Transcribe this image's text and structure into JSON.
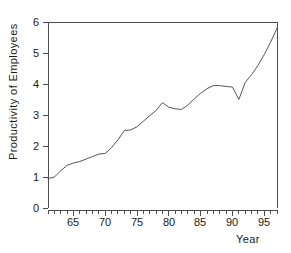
{
  "chart_data": {
    "type": "line",
    "title": "",
    "xlabel": "Year",
    "ylabel": "Productivity of Employees",
    "xlim": [
      61,
      97
    ],
    "ylim": [
      0,
      6
    ],
    "grid": false,
    "legend": null,
    "x_major_ticks": [
      65,
      70,
      75,
      80,
      85,
      90,
      95
    ],
    "x_major_tick_labels": [
      "65",
      "70",
      "75",
      "80",
      "85",
      "90",
      "95"
    ],
    "x_minor_tick_step": 1,
    "y_major_ticks": [
      0,
      1,
      2,
      3,
      4,
      5,
      6
    ],
    "y_major_tick_labels": [
      "0",
      "1",
      "2",
      "3",
      "4",
      "5",
      "6"
    ],
    "series": [
      {
        "name": "Productivity of Employees",
        "color": "#555555",
        "x": [
          61,
          62,
          63,
          64,
          65,
          66,
          67,
          68,
          69,
          70,
          71,
          72,
          73,
          74,
          75,
          76,
          77,
          78,
          79,
          80,
          81,
          82,
          83,
          84,
          85,
          86,
          87,
          88,
          89,
          90,
          91,
          92,
          93,
          94,
          95,
          96,
          97
        ],
        "values": [
          0.95,
          1.0,
          1.2,
          1.38,
          1.45,
          1.5,
          1.58,
          1.66,
          1.74,
          1.76,
          1.95,
          2.2,
          2.5,
          2.52,
          2.62,
          2.8,
          2.98,
          3.15,
          3.4,
          3.25,
          3.2,
          3.18,
          3.32,
          3.52,
          3.7,
          3.85,
          3.95,
          3.95,
          3.92,
          3.9,
          3.5,
          4.05,
          4.3,
          4.6,
          4.95,
          5.35,
          5.8
        ]
      }
    ],
    "annotations": []
  },
  "axis_title_x": "Year",
  "axis_title_y": "Productivity of Employees"
}
